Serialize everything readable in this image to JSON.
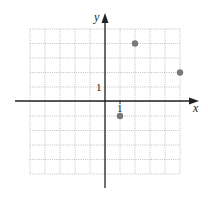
{
  "chart_data": {
    "type": "scatter",
    "title": "",
    "xlabel": "x",
    "ylabel": "y",
    "xlim": [
      -5,
      5
    ],
    "ylim": [
      -5,
      5
    ],
    "grid": true,
    "grid_style": "dotted",
    "unit_tick_labels": {
      "x": "1",
      "y": "1"
    },
    "origin_label": "",
    "series": [
      {
        "name": "points",
        "points": [
          {
            "x": 2,
            "y": 4
          },
          {
            "x": 5,
            "y": 2
          },
          {
            "x": 1,
            "y": -1
          }
        ]
      }
    ],
    "legend": null
  },
  "style": {
    "point_color": "#7a7a7a",
    "axis_color": "#222222",
    "grid_color": "#b0b0b0"
  },
  "labels": {
    "x_axis": "x",
    "y_axis": "y",
    "x_unit": "1",
    "y_unit": "1"
  }
}
